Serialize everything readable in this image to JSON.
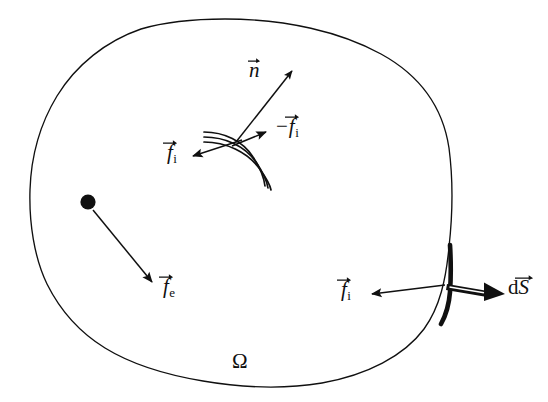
{
  "figure": {
    "domain_label": "Ω",
    "background_color": "#ffffff",
    "ink_color": "#101010",
    "labels": {
      "normal_vector": {
        "symbol": "n",
        "accent": "vector-arrow",
        "subscript": ""
      },
      "internal_force_left": {
        "symbol": "f",
        "accent": "vector-arrow",
        "subscript": "i"
      },
      "internal_force_right": {
        "prefix": "−",
        "symbol": "f",
        "accent": "vector-arrow",
        "subscript": "i"
      },
      "external_force": {
        "symbol": "f",
        "accent": "vector-arrow",
        "subscript": "e"
      },
      "boundary_force": {
        "symbol": "f",
        "accent": "vector-arrow",
        "subscript": "i"
      },
      "surface_element": {
        "prefix": "d",
        "symbol": "S",
        "accent": "vector-arrow",
        "subscript": ""
      }
    },
    "elements": {
      "body_outline": "closed irregular blob boundary of domain Omega",
      "internal_cut": "triple parallel curved lines representing internal cut surface",
      "material_point": "filled black dot inside the domain",
      "highlighted_boundary": "thickened arc segment of boundary marking dS",
      "ds_arrow_style": "hollow double-line outward arrow"
    }
  }
}
